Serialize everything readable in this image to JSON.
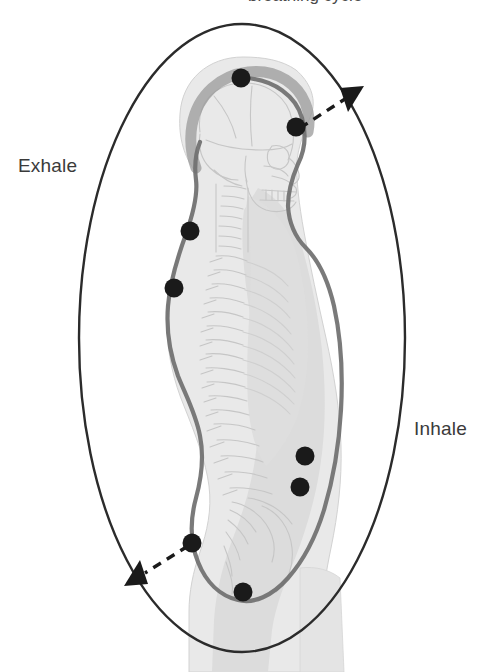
{
  "diagram": {
    "title_clipped": "breathing cycle",
    "labels": {
      "exhale": "Exhale",
      "inhale": "Inhale"
    },
    "colors": {
      "ellipse_stroke": "#2b2b2b",
      "body_fill": "#e9e9e9",
      "organ_fill": "#dcdcdc",
      "contour_line": "#6f6f6f",
      "skull_halo": "#9a9a9a",
      "marker_dot": "#1a1a1a",
      "bone_line": "#c9c9c9",
      "text": "#3a3a3a",
      "background": "#ffffff"
    },
    "ellipse": {
      "cx": 242,
      "cy": 338,
      "rx": 163,
      "ry": 314,
      "stroke_width": 2.4,
      "direction": "counter-clockwise"
    },
    "arrows": [
      {
        "name": "inhale-arrow",
        "from_dot": "face-marker",
        "points_to": "upper-right",
        "style": "dashed",
        "head_x": 356,
        "head_y": 92
      },
      {
        "name": "exhale-arrow",
        "from_dot": "sacrum-marker",
        "points_to": "lower-left",
        "style": "dashed",
        "head_x": 132,
        "head_y": 578
      }
    ],
    "markers": [
      {
        "name": "cranium-marker",
        "x": 241,
        "y": 78,
        "r": 9
      },
      {
        "name": "face-marker",
        "x": 296,
        "y": 127,
        "r": 9
      },
      {
        "name": "upper-thoracic-marker",
        "x": 190,
        "y": 231,
        "r": 9
      },
      {
        "name": "mid-thoracic-marker",
        "x": 174,
        "y": 288,
        "r": 9
      },
      {
        "name": "upper-abdomen-marker",
        "x": 305,
        "y": 456,
        "r": 9
      },
      {
        "name": "lower-abdomen-marker",
        "x": 300,
        "y": 487,
        "r": 9
      },
      {
        "name": "sacrum-marker",
        "x": 192,
        "y": 543,
        "r": 9
      },
      {
        "name": "pelvic-floor-marker",
        "x": 243,
        "y": 592,
        "r": 9
      }
    ],
    "figure": {
      "view": "sagittal",
      "anatomy": [
        "skull",
        "cervical-spine",
        "thoracic-spine",
        "lumbar-spine",
        "sacrum",
        "torso",
        "thigh"
      ]
    }
  }
}
